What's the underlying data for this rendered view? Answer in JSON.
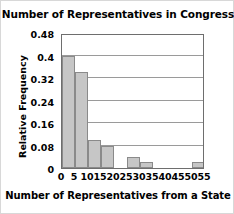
{
  "chart_data": {
    "type": "bar",
    "title": "Number of Representatives in Congress",
    "xlabel": "Number of Representatives from a State",
    "ylabel": "Relative Frequency",
    "categories": [
      "0-5",
      "5-10",
      "10-15",
      "15-20",
      "20-25",
      "25-30",
      "30-35",
      "35-40",
      "40-45",
      "45-50",
      "50-55"
    ],
    "bin_starts": [
      0,
      5,
      10,
      15,
      20,
      25,
      30,
      35,
      40,
      45,
      50
    ],
    "bin_width": 5,
    "values": [
      0.4,
      0.34,
      0.1,
      0.08,
      0,
      0.04,
      0.02,
      0,
      0,
      0,
      0.02
    ],
    "xlim": [
      0,
      55
    ],
    "ylim": [
      0,
      0.48
    ],
    "xticks": [
      "0",
      "5",
      "10",
      "15",
      "20",
      "25",
      "30",
      "35",
      "40",
      "45",
      "50",
      "55"
    ],
    "xtick_values": [
      0,
      5,
      10,
      15,
      20,
      25,
      30,
      35,
      40,
      45,
      50,
      55
    ],
    "yticks": [
      "0",
      "0.08",
      "0.16",
      "0.24",
      "0.32",
      "0.4",
      "0.48"
    ],
    "ytick_values": [
      0,
      0.08,
      0.16,
      0.24,
      0.32,
      0.4,
      0.48
    ],
    "grid": true,
    "grid_axis": "y",
    "legend": null,
    "bar_color": "#c6c6c6",
    "bar_edge_color": "#8a8a8a",
    "frame_color": "#6e6e6e",
    "gridline_color": "#9a9a9a",
    "background_color": "#ffffff"
  }
}
